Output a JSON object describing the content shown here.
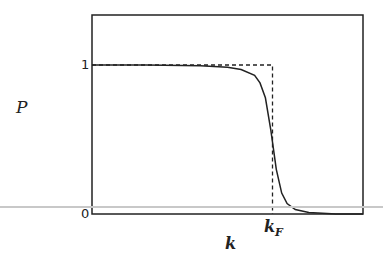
{
  "chart_data": {
    "type": "line",
    "title": "",
    "xlabel": "k",
    "ylabel": "P",
    "x_ticks": [
      {
        "label": "k_F",
        "base": "k",
        "sub": "F",
        "position": 0.666
      }
    ],
    "y_ticks": [
      {
        "label": "0",
        "value": 0
      },
      {
        "label": "1",
        "value": 1
      }
    ],
    "ylim": [
      0,
      1.35
    ],
    "xlim": [
      0,
      1
    ],
    "grid": false,
    "legend": null,
    "series": [
      {
        "name": "smooth Fermi-like distribution",
        "style": "solid",
        "x": [
          0.0,
          0.2,
          0.4,
          0.5,
          0.55,
          0.6,
          0.62,
          0.64,
          0.66,
          0.68,
          0.7,
          0.72,
          0.75,
          0.8,
          0.9,
          1.0
        ],
        "y": [
          1.0,
          1.0,
          0.995,
          0.985,
          0.97,
          0.93,
          0.88,
          0.78,
          0.56,
          0.3,
          0.14,
          0.07,
          0.03,
          0.01,
          0.0,
          0.0
        ]
      },
      {
        "name": "step function",
        "style": "dashed",
        "x": [
          0.0,
          0.666,
          0.666
        ],
        "y": [
          1.0,
          1.0,
          0.0
        ]
      }
    ]
  },
  "labels": {
    "y_axis": "P",
    "x_axis": "k",
    "kf_base": "k",
    "kf_sub": "F",
    "tick_one": "1",
    "tick_zero": "0"
  }
}
